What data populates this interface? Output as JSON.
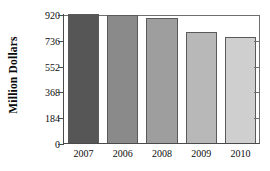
{
  "chart_data": {
    "type": "bar",
    "title": "",
    "xlabel": "",
    "ylabel": "Million Dollars",
    "categories": [
      "2007",
      "2006",
      "2008",
      "2009",
      "2010"
    ],
    "values": [
      920,
      912,
      891,
      789,
      758
    ],
    "ylim": [
      0,
      920
    ],
    "yticks": [
      0,
      184,
      368,
      552,
      736,
      920
    ],
    "ytick_labels": [
      "0",
      "184",
      "368",
      "552",
      "736",
      "920"
    ],
    "grid": false,
    "legend": null,
    "bar_colors": [
      "#565656",
      "#8a8a8a",
      "#9e9e9e",
      "#b8b8b8",
      "#cfcfcf"
    ],
    "bar_edge_color": "#5a5a5a",
    "axis_color": "#4a4a4a",
    "background": "#ffffff"
  }
}
